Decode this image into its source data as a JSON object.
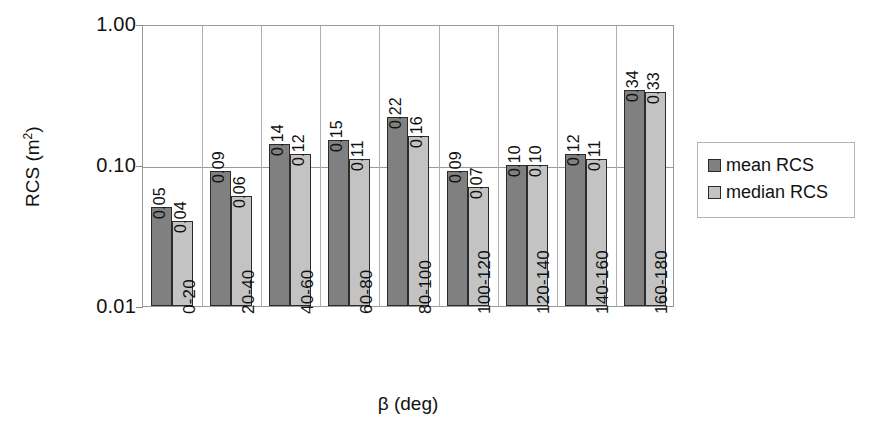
{
  "chart_data": {
    "type": "bar",
    "title": "",
    "xlabel": "β (deg)",
    "ylabel": "RCS (m²)",
    "yscale": "log",
    "ylim": [
      0.01,
      1.0
    ],
    "ytick_labels": [
      "1.00",
      "0.10",
      "0.01"
    ],
    "ytick_values": [
      1.0,
      0.1,
      0.01
    ],
    "grid": "vertical-per-category plus horizontal at 0.10",
    "legend_position": "right",
    "categories": [
      "0-20",
      "20-40",
      "40-60",
      "60-80",
      "80-100",
      "100-120",
      "120-140",
      "140-160",
      "160-180"
    ],
    "series": [
      {
        "name": "mean RCS",
        "color": "#808080",
        "values": [
          0.05,
          0.09,
          0.14,
          0.15,
          0.22,
          0.09,
          0.1,
          0.12,
          0.34
        ],
        "labels": [
          "0.05",
          "0.09",
          "0.14",
          "0.15",
          "0.22",
          "0.09",
          "0.10",
          "0.12",
          "0.34"
        ]
      },
      {
        "name": "median RCS",
        "color": "#c3c3c3",
        "values": [
          0.04,
          0.06,
          0.12,
          0.11,
          0.16,
          0.07,
          0.1,
          0.11,
          0.33
        ],
        "labels": [
          "0.04",
          "0.06",
          "0.12",
          "0.11",
          "0.16",
          "0.07",
          "0.10",
          "0.11",
          "0.33"
        ]
      }
    ]
  },
  "legend": {
    "items": [
      {
        "label": "mean RCS",
        "swatch": "mean"
      },
      {
        "label": "median RCS",
        "swatch": "median"
      }
    ]
  }
}
